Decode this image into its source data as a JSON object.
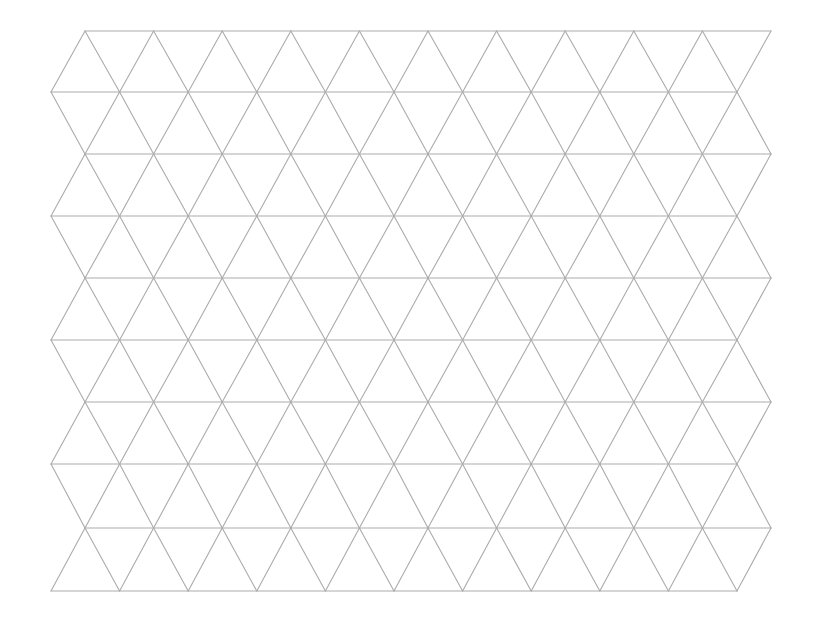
{
  "diagram": {
    "type": "triangular-grid",
    "line_color": "#ababab",
    "background_color": "#ffffff",
    "line_width": 1.1,
    "rows": 9,
    "columns": 10,
    "horizontal_lines_y": [
      31,
      92,
      154,
      216,
      278,
      340,
      402,
      464,
      528,
      591
    ],
    "even_line_x_start": 85,
    "even_line_x_end": 771,
    "odd_line_x_start": 51,
    "odd_line_x_end": 737
  }
}
